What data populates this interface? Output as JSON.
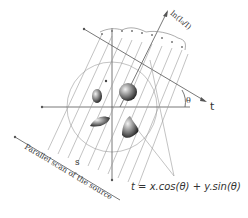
{
  "diagram": {
    "labels": {
      "projection_axis": "ln(I₀/I)",
      "t_axis": "t",
      "angle": "θ",
      "ray_coordinate": "s",
      "source_scan": "Parallel scan of the source",
      "formula": "t = x.cos(θ) + y.sin(θ)"
    },
    "colors": {
      "lines": "#9a9a9a",
      "axes": "#555555",
      "text": "#333333",
      "background": "#ffffff"
    }
  }
}
